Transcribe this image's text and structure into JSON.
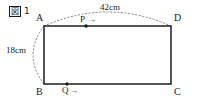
{
  "figure": {
    "caption_prefix": "図",
    "caption_number": "1",
    "caption_full": "図 1"
  },
  "shape": {
    "type": "rectangle",
    "vertices": [
      {
        "name": "A",
        "label": "A",
        "position": "top-left"
      },
      {
        "name": "D",
        "label": "D",
        "position": "top-right"
      },
      {
        "name": "B",
        "label": "B",
        "position": "bottom-left"
      },
      {
        "name": "C",
        "label": "C",
        "position": "bottom-right"
      }
    ],
    "stroke_color": "#2b2b2b"
  },
  "dimensions": [
    {
      "name": "width",
      "value": "42cm",
      "edge": "AD",
      "annotation_style": "dotted-arc"
    },
    {
      "name": "height",
      "value": "18cm",
      "edge": "AB",
      "annotation_style": "dotted-arc"
    }
  ],
  "moving_points": [
    {
      "name": "P",
      "label": "P",
      "on_edge": "AD",
      "direction": "right",
      "arrow_glyph": "→"
    },
    {
      "name": "Q",
      "label": "Q",
      "on_edge": "BC",
      "direction": "right",
      "arrow_glyph": "→"
    }
  ],
  "colors": {
    "ink": "#1a1a1a",
    "line": "#2b2b2b",
    "dotted": "#8a8a8a",
    "background": "#ffffff"
  }
}
